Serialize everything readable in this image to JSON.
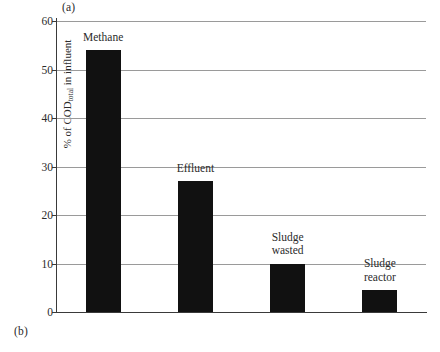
{
  "figure": {
    "panel_a_label": "(a)",
    "panel_b_label": "(b)"
  },
  "chart_data": {
    "type": "bar",
    "title": "",
    "subtitle": "",
    "xlabel": "",
    "ylabel": "% of COD",
    "ylabel_subscript": "total",
    "ylabel_suffix": " in influent",
    "ylabel_full": "% of CODtotal in influent",
    "categories": [
      "Methane",
      "Effluent",
      "Sludge wasted",
      "Sludge reactor"
    ],
    "category_lines": [
      [
        "Methane"
      ],
      [
        "Effluent"
      ],
      [
        "Sludge",
        "wasted"
      ],
      [
        "Sludge",
        "reactor"
      ]
    ],
    "values": [
      54,
      27,
      10,
      4.5
    ],
    "ylim": [
      0,
      60
    ],
    "yticks": [
      0,
      10,
      20,
      30,
      40,
      50,
      60
    ],
    "ytick_labels": [
      "0",
      "10",
      "20",
      "30",
      "40",
      "50",
      "60"
    ],
    "grid": true,
    "grid_axis": "y",
    "legend": false,
    "legend_position": "none",
    "bar_color": "#111111",
    "grid_color": "#9a9a9a",
    "axis_color": "#3a3a3a",
    "label_position": "above-bar"
  }
}
